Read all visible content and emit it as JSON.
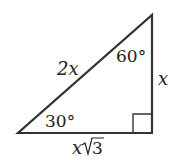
{
  "diagram": {
    "type": "30-60-90 right triangle",
    "colors": {
      "stroke": "#333333",
      "text": "#222222",
      "background": "#ffffff"
    },
    "labels": {
      "hypotenuse": "2x",
      "short_leg": "x",
      "long_leg_var": "x",
      "long_leg_root": "3",
      "angle_top": "60°",
      "angle_bottom_left": "30°"
    }
  }
}
